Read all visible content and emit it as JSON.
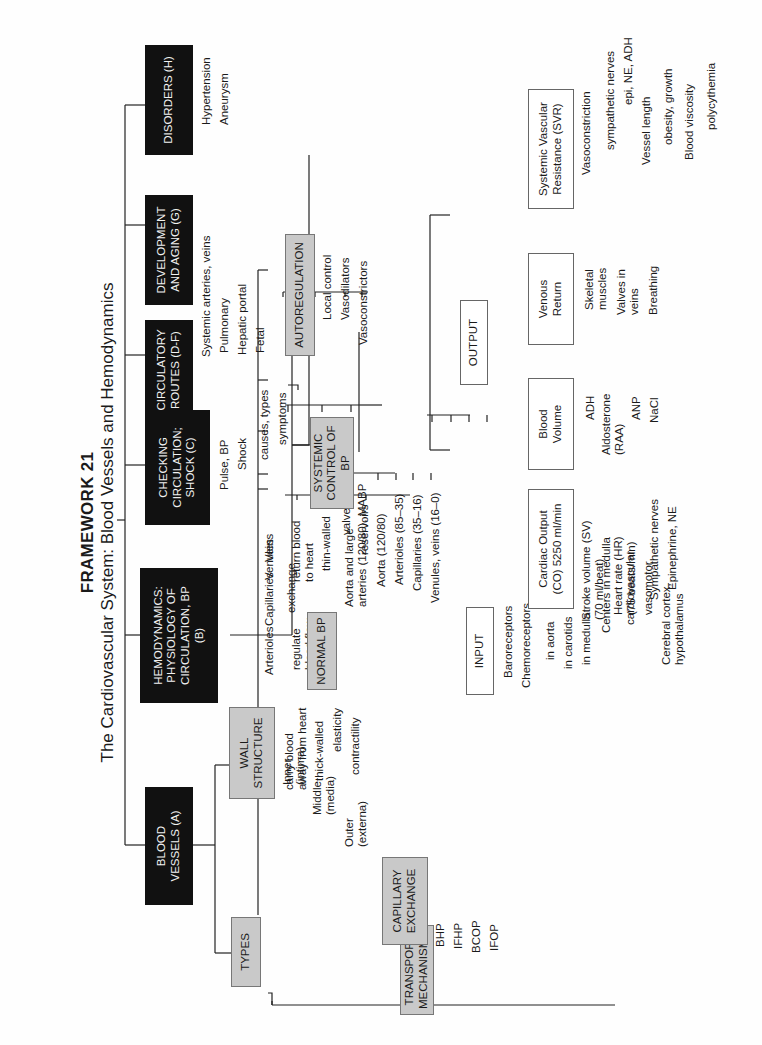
{
  "header": {
    "title": "FRAMEWORK 21",
    "subtitle": "The Cardiovascular System: Blood Vessels and Hemodynamics"
  },
  "topics": {
    "blood_vessels": "BLOOD\nVESSELS (A)",
    "hemodynamics": "HEMODYNAMICS:\nPHYSIOLOGY OF\nCIRCULATION, BP\n(B)",
    "checking": "CHECKING\nCIRCULATION;\nSHOCK (C)",
    "routes": "CIRCULATORY\nROUTES (D-F)",
    "development": "DEVELOPMENT\nAND AGING (G)",
    "disorders": "DISORDERS (H)"
  },
  "blood_vessels": {
    "types": {
      "label": "TYPES",
      "arteries": "Arteries",
      "arteries_traits": [
        "carry blood\naway from heart",
        "thick-walled",
        "elasticity",
        "contractility"
      ],
      "arterioles": "Arterioles",
      "arterioles_traits": [
        "regulate\nblood flow"
      ],
      "capillaries": "Capillaries",
      "capillaries_traits": [
        "exchange"
      ],
      "venules": "Venules",
      "veins": "Veins",
      "veins_traits": [
        "return blood\nto heart",
        "thin-walled",
        "valves",
        "reservoirs"
      ]
    },
    "wall_structure": {
      "label": "WALL\nSTRUCTURE",
      "items": [
        "Inner\n(intima)",
        "Middle\n(media)",
        "Outer\n(externa)"
      ]
    },
    "capillary_exchange": {
      "label": "CAPILLARY\nEXCHANGE",
      "items": [
        "BHP",
        "IFHP",
        "BCOP",
        "IFOP"
      ]
    },
    "transport": "TRANSPORT\nMECHANISMS"
  },
  "hemodynamics": {
    "normal_bp": {
      "label": "NORMAL BP",
      "items": [
        "Aorta and large\narteries (120/80), MABP",
        "Aorta (120/80)",
        "Arterioles (85–35)",
        "Capillaries (35–16)",
        "Venules, veins (16–0)"
      ]
    },
    "systemic_control": "SYSTEMIC\nCONTROL OF BP",
    "autoregulation": {
      "label": "AUTOREGULATION",
      "items": [
        "Local control",
        "Vasodilators",
        "Vasoconstrictors"
      ]
    },
    "input": {
      "label": "INPUT",
      "baroreceptors": "Baroreceptors",
      "chemoreceptors": "Chemoreceptors",
      "chemo_items": [
        "in aorta",
        "in carotids",
        "in medulla"
      ],
      "centers": "Centers in medulla",
      "centers_items": [
        "cardiovascular",
        "vasomotor"
      ],
      "cerebral": "Cerebral cortex,\nhypothalamus"
    },
    "output": {
      "label": "OUTPUT",
      "cardiac_output": {
        "label": "Cardiac Output\n(CO) 5250 ml/min",
        "items": [
          "Stroke volume (SV)\n(70 ml/beat)",
          "Heart rate (HR)\n(75 beats/min)"
        ],
        "hr_items": [
          "Sympathetic nerves",
          "Epinephrine, NE"
        ]
      },
      "blood_volume": {
        "label": "Blood\nVolume",
        "items": [
          "ADH",
          "Aldosterone\n(RAA)",
          "ANP",
          "NaCl"
        ]
      },
      "venous_return": {
        "label": "Venous\nReturn",
        "items": [
          "Skeletal\nmuscles",
          "Valves in\nveins",
          "Breathing"
        ]
      },
      "svr": {
        "label": "Systemic Vascular\nResistance (SVR)",
        "vasoconstriction": "Vasoconstriction",
        "vasoconstriction_items": [
          "sympathetic nerves",
          "epi, NE, ADH"
        ],
        "vessel_length": "Vessel length",
        "vessel_length_items": [
          "obesity, growth"
        ],
        "blood_viscosity": "Blood viscosity",
        "blood_viscosity_items": [
          "polycythemia"
        ]
      }
    }
  },
  "checking": {
    "items": [
      "Pulse, BP",
      "Shock"
    ],
    "shock_items": [
      "causes, types",
      "symptoms"
    ]
  },
  "routes": {
    "items": [
      "Systemic arteries, veins",
      "Pulmonary",
      "Hepatic portal",
      "Fetal"
    ]
  },
  "disorders": {
    "items": [
      "Hypertension",
      "Aneurysm"
    ]
  }
}
